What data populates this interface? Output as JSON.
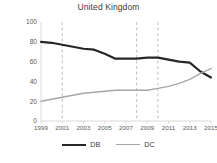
{
  "chart_data": {
    "type": "line",
    "title": "United Kingdom",
    "xlabel": "",
    "ylabel": "% of all occupational pension plans",
    "x": [
      1999,
      2000,
      2001,
      2002,
      2003,
      2004,
      2005,
      2006,
      2007,
      2008,
      2009,
      2010,
      2011,
      2012,
      2013,
      2014,
      2015
    ],
    "xlim": [
      1999,
      2015
    ],
    "ylim": [
      0,
      100
    ],
    "yticks": [
      0,
      20,
      40,
      60,
      80,
      100
    ],
    "xticks": [
      1999,
      2001,
      2003,
      2005,
      2007,
      2009,
      2011,
      2013,
      2015
    ],
    "grid": false,
    "legend_position": "bottom",
    "series": [
      {
        "name": "DB",
        "color": "#262626",
        "values": [
          80,
          79,
          77,
          75,
          73,
          72,
          68,
          63,
          63,
          63,
          64,
          64,
          62,
          60,
          59,
          50,
          44
        ]
      },
      {
        "name": "DC",
        "color": "#a6a6a6",
        "values": [
          20,
          22,
          24,
          26,
          28,
          29,
          30,
          31,
          31,
          31,
          31,
          33,
          35,
          38,
          42,
          48,
          53
        ]
      }
    ],
    "annotations": [
      {
        "type": "vline",
        "x": 2001,
        "style": "dashed",
        "color": "#bfbfbf"
      },
      {
        "type": "vline",
        "x": 2008,
        "style": "dashed",
        "color": "#bfbfbf"
      },
      {
        "type": "vline",
        "x": 2010,
        "style": "dashed",
        "color": "#bfbfbf"
      }
    ]
  },
  "legend": {
    "items": [
      {
        "label": "DB",
        "color": "#262626",
        "width": 2.2
      },
      {
        "label": "DC",
        "color": "#a6a6a6",
        "width": 1.4
      }
    ]
  }
}
